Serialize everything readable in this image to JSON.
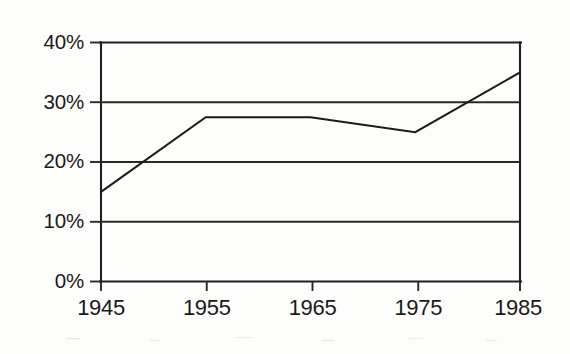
{
  "chart_data": {
    "type": "line",
    "title": "",
    "subtitle": "",
    "xlabel": "",
    "ylabel": "",
    "x": [
      1945,
      1955,
      1965,
      1975,
      1985
    ],
    "categories": [
      "1945",
      "1955",
      "1965",
      "1975",
      "1985"
    ],
    "values": [
      15,
      27.5,
      27.5,
      25,
      35
    ],
    "series": [
      {
        "name": "",
        "values": [
          15,
          27.5,
          27.5,
          25,
          35
        ]
      }
    ],
    "xlim": [
      1945,
      1985
    ],
    "ylim": [
      0,
      40
    ],
    "ytick_values": [
      0,
      10,
      20,
      30,
      40
    ],
    "ytick_labels": [
      "0%",
      "10%",
      "20%",
      "30%",
      "40%"
    ],
    "xtick_labels": [
      "1945",
      "1955",
      "1965",
      "1975",
      "1985"
    ],
    "grid": "horizontal",
    "gridlines_at": [
      10,
      20,
      30
    ],
    "legend": "none",
    "legend_position": "",
    "annotations": [],
    "line_color": "#1d1a19",
    "axis_color": "#231f20",
    "background_color": "#fdfdfb"
  },
  "axis": {
    "y_labels": [
      "40%",
      "30%",
      "20%",
      "10%",
      "0%"
    ],
    "x_labels": [
      "1945",
      "1955",
      "1965",
      "1975",
      "1985"
    ]
  }
}
